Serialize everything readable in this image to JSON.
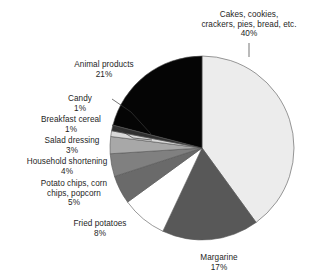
{
  "chart_data": {
    "type": "pie",
    "title": "",
    "subtitle": "",
    "xlabel": "",
    "ylabel": "",
    "units": "percent",
    "legend_position": "none",
    "grid": false,
    "label_format": "name + percent",
    "start_angle_deg": 0,
    "direction": "clockwise",
    "categories": [
      "Cakes, cookies, crackers, pies, bread, etc.",
      "Margarine",
      "Fried potatoes",
      "Potato chips, corn chips, popcorn",
      "Household shortening",
      "Salad dressing",
      "Breakfast cereal",
      "Candy",
      "Animal products"
    ],
    "values": [
      40,
      17,
      8,
      5,
      4,
      3,
      1,
      1,
      21
    ],
    "colors": [
      "#ececec",
      "#585858",
      "#ffffff",
      "#6a6a6a",
      "#808080",
      "#a8a8a8",
      "#d8d8d8",
      "#303030",
      "#050505"
    ],
    "slice_border_color": "#555555",
    "slices": [
      {
        "name": "Cakes, cookies, crackers, pies, bread, etc.",
        "value": 40,
        "percent_label": "40%",
        "color": "#ececec"
      },
      {
        "name": "Margarine",
        "value": 17,
        "percent_label": "17%",
        "color": "#585858"
      },
      {
        "name": "Fried potatoes",
        "value": 8,
        "percent_label": "8%",
        "color": "#ffffff"
      },
      {
        "name": "Potato chips, corn chips, popcorn",
        "value": 5,
        "percent_label": "5%",
        "color": "#6a6a6a"
      },
      {
        "name": "Household shortening",
        "value": 4,
        "percent_label": "4%",
        "color": "#808080"
      },
      {
        "name": "Salad dressing",
        "value": 3,
        "percent_label": "3%",
        "color": "#a8a8a8"
      },
      {
        "name": "Breakfast cereal",
        "value": 1,
        "percent_label": "1%",
        "color": "#d8d8d8"
      },
      {
        "name": "Candy",
        "value": 1,
        "percent_label": "1%",
        "color": "#303030"
      },
      {
        "name": "Animal products",
        "value": 21,
        "percent_label": "21%",
        "color": "#050505"
      }
    ]
  },
  "labels": {
    "cakes": {
      "line1": "Cakes, cookies,",
      "line2": "crackers, pies, bread, etc.",
      "pct": "40%"
    },
    "animal": {
      "line1": "Animal products",
      "pct": "21%"
    },
    "candy": {
      "line1": "Candy",
      "pct": "1%"
    },
    "cereal": {
      "line1": "Breakfast cereal",
      "pct": "1%"
    },
    "salad": {
      "line1": "Salad dressing",
      "pct": "3%"
    },
    "shortening": {
      "line1": "Household shortening",
      "pct": "4%"
    },
    "chips": {
      "line1": "Potato chips, corn",
      "line2": "chips, popcorn",
      "pct": "5%"
    },
    "fried": {
      "line1": "Fried potatoes",
      "pct": "8%"
    },
    "margarine": {
      "line1": "Margarine",
      "pct": "17%"
    }
  }
}
